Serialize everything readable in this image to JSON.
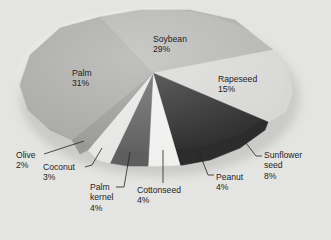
{
  "chart_data": {
    "type": "pie",
    "style": "3d-oblique-grayscale",
    "title": "",
    "categories": [
      "Soybean",
      "Rapeseed",
      "Sunflower seed",
      "Peanut",
      "Cottonseed",
      "Palm kernel",
      "Coconut",
      "Olive",
      "Palm"
    ],
    "values": [
      29,
      15,
      8,
      4,
      4,
      4,
      3,
      2,
      31
    ],
    "unit": "%",
    "legend": "none (direct labels)",
    "slices": [
      {
        "name": "Soybean",
        "value": 29,
        "label": "Soybean",
        "pct": "29%",
        "color": "#b4b4b2",
        "pts": [
          [
            153,
            73
          ],
          [
            100,
            17
          ],
          [
            140,
            10
          ],
          [
            190,
            10
          ],
          [
            235,
            20
          ],
          [
            273,
            50
          ]
        ]
      },
      {
        "name": "Rapeseed",
        "value": 15,
        "label": "Rapeseed",
        "pct": "15%",
        "color": "#d7d7d5",
        "pts": [
          [
            153,
            73
          ],
          [
            273,
            50
          ],
          [
            288,
            68
          ],
          [
            293,
            92
          ],
          [
            286,
            112
          ],
          [
            268,
            122
          ]
        ]
      },
      {
        "name": "Sunflower seed",
        "value": 8,
        "label": "Sunflower\nseed",
        "pct": "8%",
        "color": "#2c2c2c",
        "pts": [
          [
            153,
            73
          ],
          [
            268,
            122
          ],
          [
            265,
            130
          ],
          [
            240,
            148
          ],
          [
            210,
            160
          ],
          [
            183,
            165
          ]
        ]
      },
      {
        "name": "Peanut",
        "value": 4,
        "label": "Peanut",
        "pct": "4%",
        "color": "#262626",
        "pts": [
          [
            153,
            73
          ],
          [
            183,
            165
          ],
          [
            180,
            165
          ]
        ]
      },
      {
        "name": "Cottonseed",
        "value": 4,
        "label": "Cottonseed",
        "pct": "4%",
        "color": "#f0f0ee",
        "pts": [
          [
            153,
            73
          ],
          [
            180,
            165
          ],
          [
            160,
            166
          ],
          [
            148,
            166
          ]
        ]
      },
      {
        "name": "Palm kernel",
        "value": 4,
        "label": "Palm\nkernel",
        "pct": "4%",
        "color": "#5e5e5e",
        "pts": [
          [
            153,
            73
          ],
          [
            148,
            166
          ],
          [
            128,
            166
          ],
          [
            110,
            163
          ]
        ]
      },
      {
        "name": "Coconut",
        "value": 3,
        "label": "Coconut",
        "pct": "3%",
        "color": "#e6e6e4",
        "pts": [
          [
            153,
            73
          ],
          [
            110,
            163
          ],
          [
            98,
            160
          ],
          [
            88,
            150
          ]
        ]
      },
      {
        "name": "Olive",
        "value": 2,
        "label": "Olive",
        "pct": "2%",
        "color": "#999997",
        "pts": [
          [
            153,
            73
          ],
          [
            88,
            150
          ],
          [
            80,
            154
          ],
          [
            72,
            140
          ]
        ]
      },
      {
        "name": "Palm",
        "value": 31,
        "label": "Palm",
        "pct": "31%",
        "color": "#a8a8a6",
        "pts": [
          [
            153,
            73
          ],
          [
            72,
            140
          ],
          [
            50,
            130
          ],
          [
            28,
            110
          ],
          [
            20,
            85
          ],
          [
            30,
            55
          ],
          [
            60,
            28
          ],
          [
            100,
            17
          ]
        ]
      }
    ],
    "labels": [
      {
        "name": "Soybean",
        "text": "Soybean\n29%",
        "x": 153,
        "y": 34
      },
      {
        "name": "Rapeseed",
        "text": "Rapeseed\n15%",
        "x": 218,
        "y": 74
      },
      {
        "name": "Palm",
        "text": "Palm\n31%",
        "x": 72,
        "y": 68
      },
      {
        "name": "Olive",
        "text": "Olive\n2%",
        "x": 16,
        "y": 150
      },
      {
        "name": "Coconut",
        "text": "Coconut\n3%",
        "x": 43,
        "y": 162
      },
      {
        "name": "Palm kernel",
        "text": "Palm\nkernel\n4%",
        "x": 90,
        "y": 182
      },
      {
        "name": "Cottonseed",
        "text": "Cottonseed\n4%",
        "x": 137,
        "y": 185
      },
      {
        "name": "Peanut",
        "text": "Peanut\n4%",
        "x": 216,
        "y": 172
      },
      {
        "name": "Sunflower seed",
        "text": "Sunflower\nseed\n8%",
        "x": 264,
        "y": 150
      }
    ],
    "leaders": [
      {
        "name": "Olive",
        "pts": [
          [
            44,
            154
          ],
          [
            84,
            141
          ]
        ]
      },
      {
        "name": "Coconut",
        "pts": [
          [
            85,
            167
          ],
          [
            92,
            165
          ],
          [
            102,
            148
          ]
        ]
      },
      {
        "name": "Palm kernel",
        "pts": [
          [
            116,
            187
          ],
          [
            124,
            187
          ],
          [
            130,
            152
          ]
        ]
      },
      {
        "name": "Cottonseed",
        "pts": [
          [
            163,
            183
          ],
          [
            163,
            150
          ]
        ]
      },
      {
        "name": "Peanut",
        "pts": [
          [
            214,
            175
          ],
          [
            208,
            175
          ],
          [
            199,
            152
          ]
        ]
      },
      {
        "name": "Sunflower seed",
        "pts": [
          [
            262,
            156
          ],
          [
            256,
            156
          ],
          [
            246,
            143
          ]
        ]
      }
    ]
  }
}
